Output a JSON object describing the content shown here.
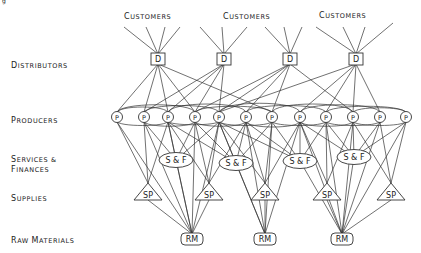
{
  "figure_caption_fragment": "g",
  "tiers": {
    "distributors": {
      "label_small": "ISTRIBUTORS",
      "label_cap": "D"
    },
    "producers": {
      "label_small": "RODUCERS",
      "label_cap": "P"
    },
    "services1": {
      "label_small": "ERVICES &",
      "label_cap": "S"
    },
    "services2": {
      "label_small": "INANCES",
      "label_cap": "F"
    },
    "supplies": {
      "label_small": "UPPLIES",
      "label_cap": "S"
    },
    "raw": {
      "label_cap1": "R",
      "label_small1": "AW ",
      "label_cap2": "M",
      "label_small2": "ATERIALS"
    }
  },
  "customers": [
    {
      "cap": "C",
      "small": "USTOMERS"
    },
    {
      "cap": "C",
      "small": "USTOMERS"
    },
    {
      "cap": "C",
      "small": "USTOMERS"
    }
  ],
  "nodes": {
    "distributor_label": "D",
    "producer_label": "P",
    "sf_label": "S & F",
    "supply_label": "SP",
    "raw_label": "RM",
    "distributor_count": 4,
    "producer_count": 12,
    "sf_count": 4,
    "supply_count": 5,
    "raw_count": 3
  }
}
